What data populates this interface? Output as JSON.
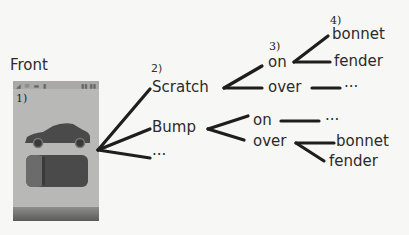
{
  "title": "Front",
  "phone": {
    "step_label": "1)",
    "status_left": "◢ ✉ ▬ ▮",
    "status_right": "▮▮ ▮▮",
    "car_side_view": "car-side-icon",
    "car_top_view": "car-top-icon",
    "colors": {
      "screen": "#b8b8b6",
      "car": "#4a4a4a",
      "car_front_highlight": "#6b6b6b"
    }
  },
  "tree": {
    "step2": "2)",
    "step3": "3)",
    "step4": "4)",
    "level1": [
      {
        "label": "Scratch",
        "children": [
          {
            "label": "on",
            "children": [
              {
                "label": "bonnet"
              },
              {
                "label": "fender"
              }
            ]
          },
          {
            "label": "over",
            "children": [
              {
                "label": "···"
              }
            ]
          }
        ]
      },
      {
        "label": "Bump",
        "children": [
          {
            "label": "on",
            "children": [
              {
                "label": "···"
              }
            ]
          },
          {
            "label": "over",
            "children": [
              {
                "label": "bonnet"
              },
              {
                "label": "fender"
              }
            ]
          }
        ]
      },
      {
        "label": "···"
      }
    ]
  },
  "colors": {
    "background": "#f7f7f5",
    "line": "#1e1e1e",
    "text": "#2b2b2b"
  }
}
